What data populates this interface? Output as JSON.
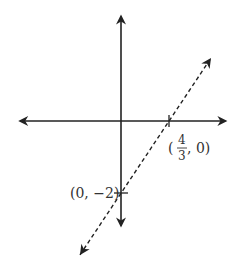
{
  "chart_data": {
    "type": "line",
    "title": "",
    "xlabel": "",
    "ylabel": "",
    "xlim": [
      -2.8,
      2.9
    ],
    "ylim": [
      -2.9,
      2.9
    ],
    "grid": false,
    "axes": {
      "x_arrows": true,
      "y_arrows": true
    },
    "series": [
      {
        "name": "line",
        "style": "dashed",
        "slope": 1.5,
        "intercept": -2,
        "x": [
          -1.14,
          2.5
        ],
        "y": [
          -3.72,
          1.75
        ]
      }
    ],
    "annotations": [
      {
        "point": [
          1.3333,
          0
        ],
        "text_prefix": "(",
        "numerator": "4",
        "denominator": "3",
        "text_suffix": ", 0)",
        "position": "below-right"
      },
      {
        "point": [
          0,
          -2
        ],
        "text": "(0, −2)",
        "position": "left"
      }
    ]
  },
  "colors": {
    "axis": "#222222",
    "line": "#222222",
    "text": "#333333"
  }
}
